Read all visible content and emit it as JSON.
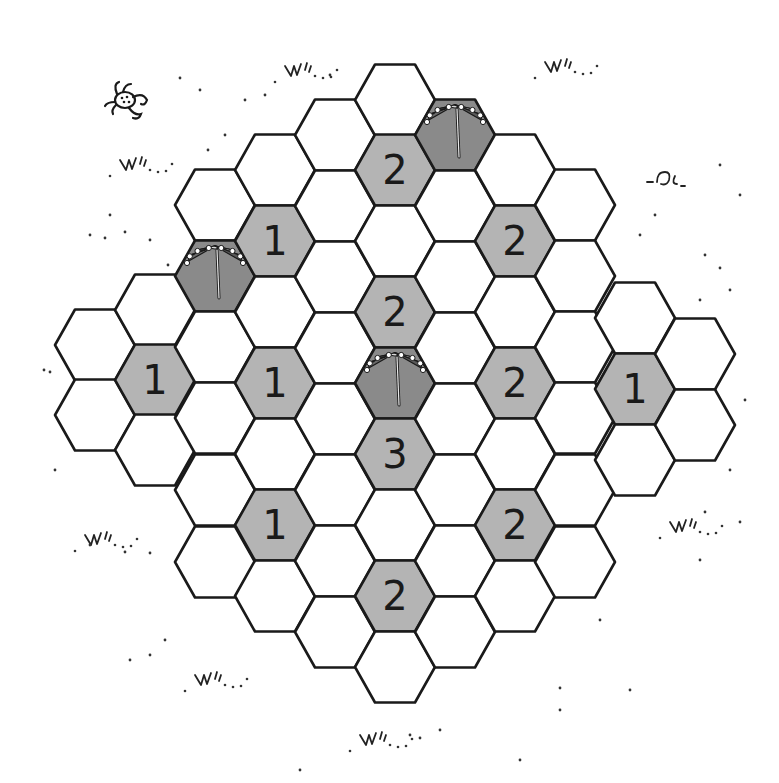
{
  "game": {
    "title": "Hex umbrella puzzle",
    "colors": {
      "background": "#ffffff",
      "hex_empty": "#ffffff",
      "hex_clue": "#b4b4b4",
      "hex_umbrella": "#8a8a8a",
      "stroke": "#1a1a1a"
    },
    "hex_radius": 40,
    "columns": [
      {
        "x": 95,
        "ys": [
          345,
          415
        ]
      },
      {
        "x": 155,
        "ys": [
          310,
          380,
          450
        ]
      },
      {
        "x": 215,
        "ys": [
          205,
          276,
          347,
          418,
          490,
          562
        ]
      },
      {
        "x": 275,
        "ys": [
          170,
          241,
          312,
          383,
          454,
          525,
          596
        ]
      },
      {
        "x": 335,
        "ys": [
          135,
          206,
          277,
          348,
          419,
          490,
          561,
          632
        ]
      },
      {
        "x": 395,
        "ys": [
          100,
          170,
          241,
          312,
          383,
          454,
          525,
          596,
          667
        ]
      },
      {
        "x": 455,
        "ys": [
          135,
          206,
          277,
          348,
          419,
          490,
          561,
          632
        ]
      },
      {
        "x": 515,
        "ys": [
          170,
          241,
          312,
          383,
          454,
          525,
          596
        ]
      },
      {
        "x": 575,
        "ys": [
          205,
          276,
          347,
          418,
          490,
          562
        ]
      },
      {
        "x": 635,
        "ys": [
          318,
          389,
          460
        ]
      },
      {
        "x": 695,
        "ys": [
          354,
          425
        ]
      }
    ],
    "clues": [
      {
        "x": 395,
        "y": 170,
        "value": "2"
      },
      {
        "x": 275,
        "y": 241,
        "value": "1"
      },
      {
        "x": 515,
        "y": 241,
        "value": "2"
      },
      {
        "x": 395,
        "y": 312,
        "value": "2"
      },
      {
        "x": 155,
        "y": 380,
        "value": "1"
      },
      {
        "x": 275,
        "y": 383,
        "value": "1"
      },
      {
        "x": 515,
        "y": 383,
        "value": "2"
      },
      {
        "x": 635,
        "y": 389,
        "value": "1"
      },
      {
        "x": 395,
        "y": 454,
        "value": "3"
      },
      {
        "x": 275,
        "y": 525,
        "value": "1"
      },
      {
        "x": 515,
        "y": 525,
        "value": "2"
      },
      {
        "x": 395,
        "y": 596,
        "value": "2"
      }
    ],
    "umbrellas": [
      {
        "x": 455,
        "y": 135
      },
      {
        "x": 215,
        "y": 276
      },
      {
        "x": 395,
        "y": 383
      }
    ],
    "decorations": [
      {
        "type": "crab-icon",
        "x": 125,
        "y": 100
      },
      {
        "type": "grass-tuft",
        "x": 285,
        "y": 66
      },
      {
        "type": "grass-tuft",
        "x": 120,
        "y": 160
      },
      {
        "type": "grass-tuft",
        "x": 85,
        "y": 535
      },
      {
        "type": "grass-tuft",
        "x": 195,
        "y": 675
      },
      {
        "type": "grass-tuft",
        "x": 360,
        "y": 735
      },
      {
        "type": "grass-tuft",
        "x": 670,
        "y": 522
      },
      {
        "type": "grass-tuft",
        "x": 545,
        "y": 62
      },
      {
        "type": "shell-squiggle",
        "x": 665,
        "y": 180
      }
    ]
  }
}
